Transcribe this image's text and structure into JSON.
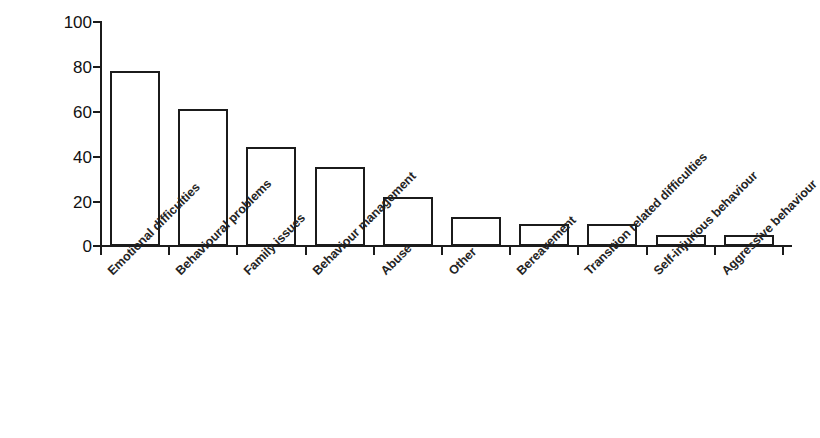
{
  "chart_data": {
    "type": "bar",
    "title": "",
    "xlabel": "",
    "ylabel": "Percentage",
    "ylim": [
      0,
      100
    ],
    "yticks": [
      0,
      20,
      40,
      60,
      80,
      100
    ],
    "grid": false,
    "legend": null,
    "categories": [
      "Emotional difficulties",
      "Behavioural problems",
      "Family issues",
      "Behaviour management",
      "Abuse",
      "Other",
      "Bereavement",
      "Transition related difficulties",
      "Self-injurious behaviour",
      "Aggressive behaviour"
    ],
    "values": [
      78,
      61,
      44,
      35,
      22,
      13,
      10,
      10,
      5,
      5
    ]
  },
  "axis": {
    "y_title": "Percentage",
    "y_tick_labels": [
      "100",
      "80",
      "60",
      "40",
      "20",
      "0"
    ]
  }
}
